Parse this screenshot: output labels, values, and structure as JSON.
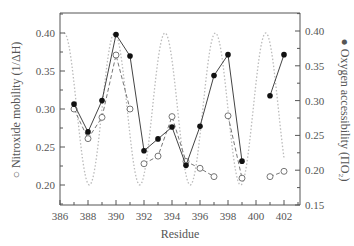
{
  "chart_data": {
    "type": "line",
    "title": "",
    "xlabel": "Residue",
    "ylabel_left": "Nitroxide mobility (1/ΔH)",
    "ylabel_left_marker": "○",
    "ylabel_right": "Oxygen accessibility (ΠO₂)",
    "ylabel_right_marker": "●",
    "xlim": [
      386,
      403.2
    ],
    "xticks": [
      386,
      388,
      390,
      392,
      394,
      396,
      398,
      400,
      402
    ],
    "ylim_left": [
      0.174,
      0.426
    ],
    "yticks_left": [
      "0.20",
      "0.25",
      "0.30",
      "0.35",
      "0.40"
    ],
    "ylim_right": [
      0.15,
      0.426
    ],
    "yticks_right": [
      "0.15",
      "0.20",
      "0.25",
      "0.30",
      "0.35",
      "0.40"
    ],
    "grid": false,
    "series": [
      {
        "name": "Nitroxide mobility (open circles, dashed)",
        "axis": "left",
        "marker": "open-circle",
        "line": "dashed",
        "segments": [
          {
            "x": [
              387,
              388,
              389,
              390,
              391
            ],
            "y": [
              0.3,
              0.261,
              0.289,
              0.371,
              0.3
            ]
          },
          {
            "x": [
              392,
              393,
              394,
              395,
              396,
              397
            ],
            "y": [
              0.228,
              0.238,
              0.29,
              0.231,
              0.222,
              0.211
            ]
          },
          {
            "x": [
              398,
              399
            ],
            "y": [
              0.291,
              0.209
            ]
          },
          {
            "x": [
              401,
              402
            ],
            "y": [
              0.211,
              0.218
            ]
          }
        ]
      },
      {
        "name": "Oxygen accessibility (filled circles, solid)",
        "axis": "right",
        "marker": "filled-circle",
        "line": "solid",
        "segments": [
          {
            "x": [
              387,
              388,
              389,
              390,
              391,
              392,
              393,
              394,
              395,
              396,
              397,
              398,
              399
            ],
            "y": [
              0.295,
              0.255,
              0.3,
              0.395,
              0.364,
              0.228,
              0.245,
              0.262,
              0.207,
              0.263,
              0.336,
              0.366,
              0.213
            ]
          },
          {
            "x": [
              401,
              402
            ],
            "y": [
              0.307,
              0.366
            ]
          }
        ]
      },
      {
        "name": "Helical periodicity fit (dotted)",
        "axis": "left",
        "marker": "none",
        "line": "dotted",
        "function": {
          "kind": "sinusoid",
          "x_start": 386.3,
          "x_end": 402.0,
          "period": 3.6,
          "peak_x": 386.3,
          "min": 0.2,
          "max": 0.4
        }
      }
    ]
  }
}
